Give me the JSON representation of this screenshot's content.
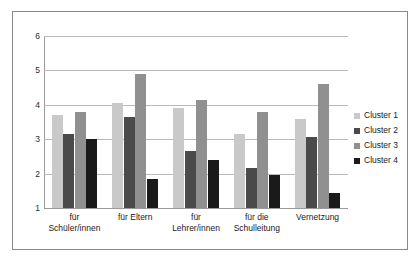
{
  "chart_data": {
    "type": "bar",
    "title": "",
    "subtitle": "",
    "xlabel": "",
    "ylabel": "",
    "categories": [
      "für Schüler/innen",
      "für Eltern",
      "für Lehrer/innen",
      "für die Schulleitung",
      "Vernetzung"
    ],
    "category_lines": [
      [
        "für",
        "Schüler/innen"
      ],
      [
        "für Eltern",
        ""
      ],
      [
        "für",
        "Lehrer/innen"
      ],
      [
        "für die",
        "Schulleitung"
      ],
      [
        "Vernetzung",
        ""
      ]
    ],
    "series": [
      {
        "name": "Cluster 1",
        "color": "#c9c9c9",
        "values": [
          3.7,
          4.05,
          3.9,
          3.15,
          3.6
        ]
      },
      {
        "name": "Cluster 2",
        "color": "#4a4a4a",
        "values": [
          3.15,
          3.65,
          2.65,
          2.15,
          3.05
        ]
      },
      {
        "name": "Cluster 3",
        "color": "#909090",
        "values": [
          3.8,
          4.9,
          4.15,
          3.8,
          4.6
        ]
      },
      {
        "name": "Cluster 4",
        "color": "#1a1a1a",
        "values": [
          3.0,
          1.85,
          2.4,
          1.95,
          1.45
        ]
      }
    ],
    "ylim": [
      1,
      6
    ],
    "yticks": [
      1,
      2,
      3,
      4,
      5,
      6
    ],
    "ytick_labels": [
      "1",
      "2",
      "3",
      "4",
      "5",
      "6"
    ],
    "grid": true,
    "legend_position": "right",
    "legend_entries": [
      "Cluster 1",
      "Cluster 2",
      "Cluster 3",
      "Cluster 4"
    ]
  }
}
